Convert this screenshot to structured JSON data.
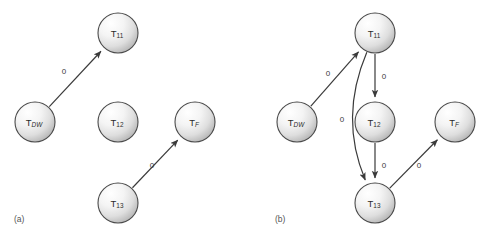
{
  "figure": {
    "background_color": "#ffffff",
    "node_outline_color": "#4a4a4a",
    "edge_color": "#3a3a3a",
    "label_color": "#2b2b2b",
    "caption_color": "#555555",
    "width": 487,
    "height": 240
  },
  "panels": [
    {
      "id": "a",
      "caption": "(a)",
      "caption_x": 14,
      "caption_y": 220,
      "nodes": [
        {
          "id": "a-tdw",
          "base": "T",
          "sub": "DW",
          "sub_italic": true,
          "cx": 35,
          "cy": 122,
          "r": 20
        },
        {
          "id": "a-t11",
          "base": "T",
          "sub": "11",
          "sub_italic": false,
          "cx": 118,
          "cy": 33,
          "r": 20
        },
        {
          "id": "a-t12",
          "base": "T",
          "sub": "12",
          "sub_italic": false,
          "cx": 118,
          "cy": 122,
          "r": 20
        },
        {
          "id": "a-tf",
          "base": "T",
          "sub": "F",
          "sub_italic": true,
          "cx": 195,
          "cy": 122,
          "r": 20
        },
        {
          "id": "a-t13",
          "base": "T",
          "sub": "13",
          "sub_italic": false,
          "cx": 118,
          "cy": 203,
          "r": 20
        }
      ],
      "edges": [
        {
          "id": "a-edge-tdw-t11",
          "from": "a-tdw",
          "to": "a-t11",
          "label": "0",
          "label_x": 64,
          "label_y": 72
        },
        {
          "id": "a-edge-t13-tf",
          "from": "a-t13",
          "to": "a-tf",
          "label": "0",
          "label_x": 152,
          "label_y": 166
        }
      ]
    },
    {
      "id": "b",
      "caption": "(b)",
      "caption_x": 275,
      "caption_y": 220,
      "nodes": [
        {
          "id": "b-tdw",
          "base": "T",
          "sub": "DW",
          "sub_italic": true,
          "cx": 297,
          "cy": 122,
          "r": 20
        },
        {
          "id": "b-t11",
          "base": "T",
          "sub": "11",
          "sub_italic": false,
          "cx": 375,
          "cy": 33,
          "r": 20
        },
        {
          "id": "b-t12",
          "base": "T",
          "sub": "12",
          "sub_italic": false,
          "cx": 375,
          "cy": 122,
          "r": 20
        },
        {
          "id": "b-tf",
          "base": "T",
          "sub": "F",
          "sub_italic": true,
          "cx": 455,
          "cy": 122,
          "r": 20
        },
        {
          "id": "b-t13",
          "base": "T",
          "sub": "13",
          "sub_italic": false,
          "cx": 375,
          "cy": 203,
          "r": 20
        }
      ],
      "edges": [
        {
          "id": "b-edge-tdw-t11",
          "from": "b-tdw",
          "to": "b-t11",
          "label": "0",
          "label_x": 328,
          "label_y": 74
        },
        {
          "id": "b-edge-t11-t12",
          "from": "b-t11",
          "to": "b-t12",
          "label": "0",
          "label_x": 384,
          "label_y": 77
        },
        {
          "id": "b-edge-t11-t13",
          "from": "b-t11",
          "to": "b-t13",
          "label": "0",
          "label_x": 342,
          "label_y": 120,
          "curved": true
        },
        {
          "id": "b-edge-t12-t13",
          "from": "b-t12",
          "to": "b-t13",
          "label": "0",
          "label_x": 384,
          "label_y": 166
        },
        {
          "id": "b-edge-t13-tf",
          "from": "b-t13",
          "to": "b-tf",
          "label": "0",
          "label_x": 419,
          "label_y": 166
        }
      ]
    }
  ]
}
